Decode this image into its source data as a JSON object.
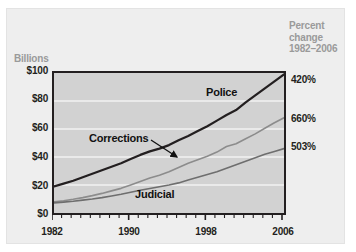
{
  "figure": {
    "axis_title": "Billions",
    "right_header": "Percent\nchange\n1982–2006"
  },
  "chart_data": {
    "type": "line",
    "title": "",
    "xlabel": "",
    "ylabel": "Billions",
    "xlim": [
      1982,
      2006
    ],
    "ylim": [
      0,
      100
    ],
    "grid": true,
    "legend": "inline-annotations",
    "ytick_labels": [
      "$100",
      "$80",
      "$60",
      "$40",
      "$20",
      "$0"
    ],
    "ytick_values": [
      100,
      80,
      60,
      40,
      20,
      0
    ],
    "xtick_labels": [
      "1982",
      "1990",
      "1998",
      "2006"
    ],
    "xtick_values": [
      1982,
      1990,
      1998,
      2006
    ],
    "minor_xticks_every": 1,
    "x": [
      1982,
      1983,
      1984,
      1985,
      1986,
      1987,
      1988,
      1989,
      1990,
      1991,
      1992,
      1993,
      1994,
      1995,
      1996,
      1997,
      1998,
      1999,
      2000,
      2001,
      2002,
      2003,
      2004,
      2005,
      2006
    ],
    "series": [
      {
        "name": "Police",
        "color": "#231f20",
        "width": 2.2,
        "percent_change_label": "420%",
        "end_value": 99,
        "values": [
          19.0,
          21.0,
          23.0,
          25.5,
          28.0,
          30.5,
          33.0,
          35.5,
          38.5,
          41.5,
          44.0,
          46.0,
          48.5,
          52.0,
          55.0,
          58.5,
          62.0,
          66.0,
          70.0,
          73.5,
          79.0,
          84.0,
          89.0,
          94.0,
          99.0
        ]
      },
      {
        "name": "Corrections",
        "color": "#8c8c8c",
        "width": 1.6,
        "percent_change_label": "660%",
        "end_value": 68,
        "values": [
          8.0,
          8.8,
          9.8,
          11.0,
          12.4,
          14.0,
          15.8,
          17.6,
          20.0,
          22.5,
          25.0,
          27.0,
          29.5,
          32.5,
          35.5,
          38.0,
          40.5,
          43.5,
          47.5,
          49.5,
          53.0,
          56.5,
          60.5,
          64.5,
          68.0
        ]
      },
      {
        "name": "Judicial",
        "color": "#6e6e6e",
        "width": 1.6,
        "percent_change_label": "503%",
        "end_value": 46,
        "values": [
          7.2,
          7.8,
          8.4,
          9.2,
          10.0,
          11.0,
          12.2,
          13.4,
          14.8,
          16.2,
          17.5,
          18.8,
          20.0,
          21.5,
          23.5,
          25.5,
          27.5,
          29.5,
          32.0,
          34.5,
          37.0,
          39.5,
          42.0,
          44.0,
          46.0
        ]
      }
    ],
    "annotations": [
      {
        "text": "Police",
        "target_series": "Police",
        "type": "label"
      },
      {
        "text": "Corrections",
        "target_series": "Corrections",
        "type": "label-with-arrow"
      },
      {
        "text": "Judicial",
        "target_series": "Judicial",
        "type": "label"
      }
    ]
  },
  "percent_labels": [
    {
      "label": "420%",
      "series": "Police"
    },
    {
      "label": "660%",
      "series": "Corrections"
    },
    {
      "label": "503%",
      "series": "Judicial"
    }
  ]
}
